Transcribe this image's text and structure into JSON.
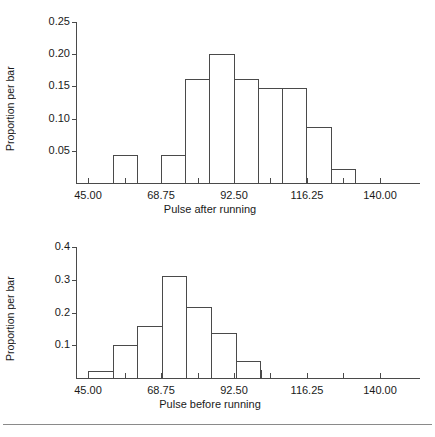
{
  "chart_data": [
    {
      "type": "bar",
      "title": "",
      "xlabel": "Pulse after running",
      "ylabel": "Proportion per bar",
      "xtick_labels": [
        "45.00",
        "68.75",
        "92.50",
        "116.25",
        "140.00"
      ],
      "xtick_values": [
        45.0,
        68.75,
        92.5,
        116.25,
        140.0
      ],
      "ytick_labels": [
        "0.05",
        "0.10",
        "0.15",
        "0.20",
        "0.25"
      ],
      "ytick_values": [
        0.05,
        0.1,
        0.15,
        0.2,
        0.25
      ],
      "xlim": [
        41.0,
        144.0
      ],
      "ylim": [
        0,
        0.25
      ],
      "grid": false,
      "bin_edges": [
        52.9,
        60.8,
        68.7,
        76.6,
        84.5,
        92.4,
        100.3,
        108.2,
        116.1,
        124.0,
        131.9
      ],
      "bin_labels": [
        "52.9-60.8",
        "60.8-68.7",
        "68.7-76.6",
        "76.6-84.5",
        "84.5-92.4",
        "92.4-100.3",
        "100.3-108.2",
        "108.2-116.1",
        "116.1-124.0",
        "124.0-131.9"
      ],
      "values": [
        0.044,
        0.0,
        0.044,
        0.161,
        0.201,
        0.161,
        0.148,
        0.148,
        0.087,
        0.022
      ]
    },
    {
      "type": "bar",
      "title": "",
      "xlabel": "Pulse before running",
      "ylabel": "Proportion per bar",
      "xtick_labels": [
        "45.00",
        "68.75",
        "92.50",
        "116.25",
        "140.00"
      ],
      "xtick_values": [
        45.0,
        68.75,
        92.5,
        116.25,
        140.0
      ],
      "ytick_labels": [
        "0.1",
        "0.2",
        "0.3",
        "0.4"
      ],
      "ytick_values": [
        0.1,
        0.2,
        0.3,
        0.4
      ],
      "xlim": [
        41.0,
        144.0
      ],
      "ylim": [
        0,
        0.4
      ],
      "grid": false,
      "bin_edges": [
        45.0,
        53.0,
        61.0,
        69.0,
        77.0,
        85.0,
        93.0,
        101.0
      ],
      "bin_labels": [
        "45-53",
        "53-61",
        "61-69",
        "69-77",
        "77-85",
        "85-93",
        "93-101"
      ],
      "values": [
        0.022,
        0.101,
        0.16,
        0.312,
        0.217,
        0.138,
        0.051,
        0.025
      ]
    }
  ]
}
